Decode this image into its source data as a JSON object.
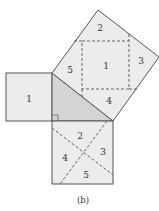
{
  "diagram": {
    "caption": "(b)",
    "colors": {
      "square_fill": "#ececec",
      "triangle_fill": "#d4d4d4",
      "stroke": "#555555"
    },
    "small_square": {
      "label": "1"
    },
    "large_square": {
      "pieces": [
        {
          "id": "top",
          "label": "2"
        },
        {
          "id": "center",
          "label": "1"
        },
        {
          "id": "right",
          "label": "3"
        },
        {
          "id": "bottom",
          "label": "4"
        },
        {
          "id": "left",
          "label": "5"
        }
      ]
    },
    "bottom_square": {
      "pieces": [
        {
          "id": "top",
          "label": "2"
        },
        {
          "id": "right",
          "label": "3"
        },
        {
          "id": "left",
          "label": "4"
        },
        {
          "id": "bottom",
          "label": "5"
        }
      ]
    }
  }
}
